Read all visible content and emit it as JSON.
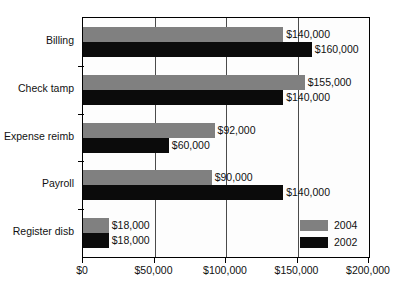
{
  "chart_data": {
    "type": "bar",
    "orientation": "horizontal",
    "title": "",
    "xlabel": "",
    "ylabel": "",
    "categories": [
      "Billing",
      "Check tamp",
      "Expense reimb",
      "Payroll",
      "Register disb"
    ],
    "series": [
      {
        "name": "2004",
        "color": "#808080",
        "values": [
          140000,
          155000,
          92000,
          90000,
          18000
        ]
      },
      {
        "name": "2002",
        "color": "#0b0b0b",
        "values": [
          160000,
          140000,
          60000,
          140000,
          18000
        ]
      }
    ],
    "value_labels": {
      "2004": [
        "$140,000",
        "$155,000",
        "$92,000",
        "$90,000",
        "$18,000"
      ],
      "2002": [
        "$160,000",
        "$140,000",
        "$60,000",
        "$140,000",
        "$18,000"
      ]
    },
    "xlim": [
      0,
      200000
    ],
    "xticks": [
      0,
      50000,
      100000,
      150000,
      200000
    ],
    "xtick_labels": [
      "$0",
      "$50,000",
      "$100,000",
      "$150,000",
      "$200,000"
    ],
    "grid": true,
    "gridlines_at": [
      50000,
      100000,
      150000
    ],
    "legend": {
      "position": "bottom-right",
      "entries": [
        {
          "label": "2004",
          "color": "#808080"
        },
        {
          "label": "2002",
          "color": "#0b0b0b"
        }
      ]
    }
  }
}
